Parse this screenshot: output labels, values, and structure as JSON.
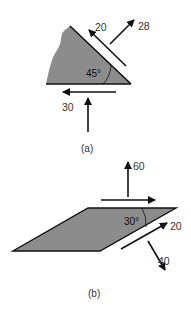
{
  "figure_a": {
    "caption": "(a)",
    "angle_label": "45°",
    "forces": {
      "shear_hypotenuse": "20",
      "normal_hypotenuse": "28",
      "shear_base": "30",
      "normal_base": ""
    }
  },
  "figure_b": {
    "caption": "(b)",
    "angle_label": "30°",
    "forces": {
      "vertical": "60",
      "horizontal": "",
      "shear_incline": "20",
      "normal_incline": "40"
    }
  },
  "colors": {
    "fill": "#8c8c8c",
    "stroke": "#111111",
    "text": "#333333"
  }
}
